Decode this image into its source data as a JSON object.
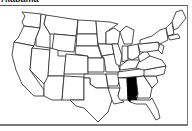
{
  "title": "Alabama",
  "map": {
    "region": "United States",
    "highlighted_state": "Alabama",
    "highlight_color": "#000000",
    "state_fill": "#ffffff",
    "border_color": "#222222"
  }
}
